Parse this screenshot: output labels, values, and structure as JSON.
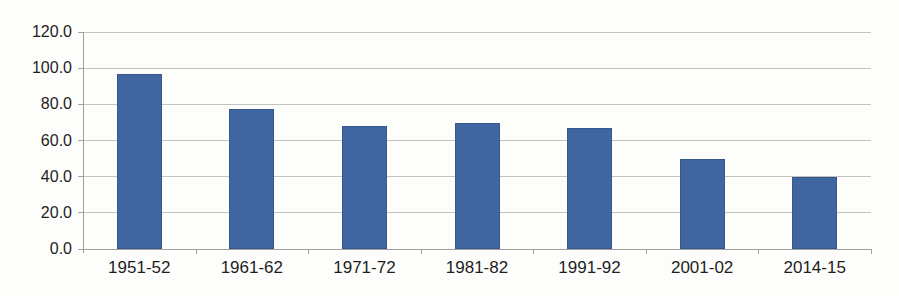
{
  "chart_data": {
    "type": "bar",
    "title": "",
    "xlabel": "",
    "ylabel": "",
    "categories": [
      "1951-52",
      "1961-62",
      "1971-72",
      "1981-82",
      "1991-92",
      "2001-02",
      "2014-15"
    ],
    "values": [
      97,
      77.5,
      68,
      69.5,
      67,
      50,
      40
    ],
    "ylim": [
      0,
      120
    ],
    "ytick_step": 20,
    "ytick_labels": [
      "120.0",
      "100.0",
      "80.0",
      "60.0",
      "40.0",
      "20.0",
      "0.0"
    ],
    "grid": true,
    "legend": false,
    "series_name": ""
  },
  "style": {
    "bar_color": "#3f66a0",
    "bar_edge_color": "#36588c",
    "gridline_color": "#c3c3c1",
    "axis_color": "#a0a09e",
    "label_color": "#1e1e1e",
    "background_color": "#fdfdfb"
  }
}
